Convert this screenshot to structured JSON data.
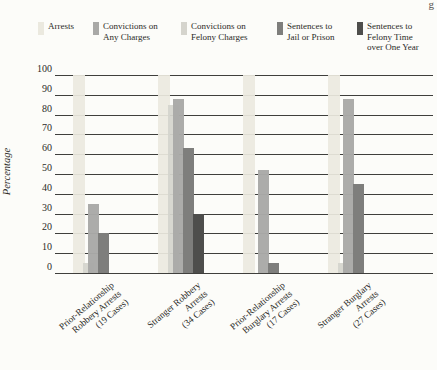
{
  "page": {
    "artifact_top_right": "g"
  },
  "chart_data": {
    "type": "bar",
    "title": "",
    "xlabel": "",
    "ylabel": "Percentage",
    "ylim": [
      0,
      100
    ],
    "y_ticks": [
      100,
      90,
      80,
      70,
      60,
      50,
      40,
      30,
      20,
      10,
      0
    ],
    "grid": "horizontal",
    "legend_position": "top",
    "categories": [
      "Prior-Relationship\nRobbery Arrests\n(19 Cases)",
      "Stranger Robbery\nArrests\n(34 Cases)",
      "Prior-Relationship\nBurglary Arrests\n(17 Cases)",
      "Stranger Burglary\nArrests\n(27 Cases)"
    ],
    "series": [
      {
        "name": "Arrests",
        "legend_label": "Arrests",
        "color": "#ebe9df",
        "values": [
          100,
          100,
          100,
          100
        ]
      },
      {
        "name": "Convictions on Any Charges",
        "legend_label": "Convictions on\nAny Charges",
        "color": "#a9a9a7",
        "values": [
          35,
          88,
          52,
          88
        ]
      },
      {
        "name": "Convictions on Felony Charges",
        "legend_label": "Convictions on\nFelony Charges",
        "color": "#d5d4cd",
        "values": [
          5,
          85,
          0,
          5
        ]
      },
      {
        "name": "Sentences to Jail or Prison",
        "legend_label": "Sentences to\nJail or Prison",
        "color": "#7e7e7c",
        "values": [
          20,
          63,
          5,
          45
        ]
      },
      {
        "name": "Sentences to Felony Time over One Year",
        "legend_label": "Sentences to\nFelony Time\nover One Year",
        "color": "#4e4e4c",
        "values": [
          0,
          30,
          0,
          0
        ]
      }
    ]
  }
}
